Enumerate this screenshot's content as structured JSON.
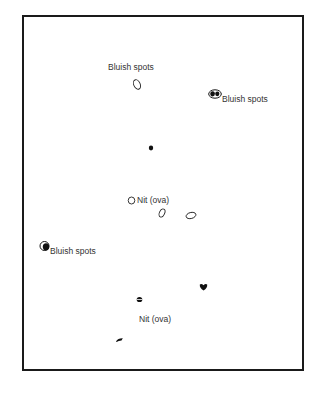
{
  "diagram": {
    "type": "illustration",
    "frame": {
      "border_color": "#1a1a1a",
      "background": "#ffffff"
    },
    "labels": [
      {
        "id": "bluish-spots-top",
        "text": "Bluish spots",
        "x": 108,
        "y": 63
      },
      {
        "id": "bluish-spots-right",
        "text": "Bluish spots",
        "x": 222,
        "y": 95
      },
      {
        "id": "nit-ova-middle",
        "text": "Nit (ova)",
        "x": 137,
        "y": 196
      },
      {
        "id": "bluish-spots-left",
        "text": "Bluish spots",
        "x": 50,
        "y": 247
      },
      {
        "id": "nit-ova-bottom",
        "text": "Nit (ova)",
        "x": 139,
        "y": 315
      }
    ],
    "marks": [
      {
        "id": "mark-outline-oval-top",
        "kind": "outline-oval",
        "x": 137,
        "y": 85
      },
      {
        "id": "mark-double-spot-right",
        "kind": "double-filled-oval",
        "x": 213,
        "y": 94
      },
      {
        "id": "mark-dot-center",
        "kind": "filled-dot",
        "x": 151,
        "y": 148
      },
      {
        "id": "mark-nit-circle",
        "kind": "outline-circle",
        "x": 131,
        "y": 200
      },
      {
        "id": "mark-nit-oval-1",
        "kind": "outline-oval-tilted",
        "x": 162,
        "y": 213
      },
      {
        "id": "mark-nit-oval-2",
        "kind": "outline-oval-flat",
        "x": 191,
        "y": 216
      },
      {
        "id": "mark-half-filled-left",
        "kind": "half-filled-circle",
        "x": 45,
        "y": 245
      },
      {
        "id": "mark-heart-spot",
        "kind": "filled-heart",
        "x": 203,
        "y": 287
      },
      {
        "id": "mark-small-nit",
        "kind": "small-split-dot",
        "x": 139,
        "y": 299
      },
      {
        "id": "mark-dash-bottom",
        "kind": "filled-dash",
        "x": 119,
        "y": 340
      }
    ]
  }
}
